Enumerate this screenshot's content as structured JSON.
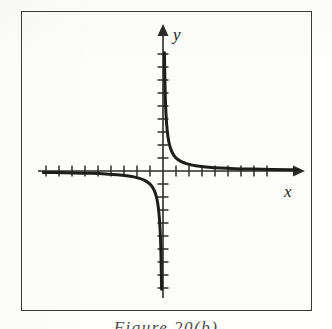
{
  "figure": {
    "caption": "Figure 20(b)",
    "frame": {
      "stroke_color": "#3a3a38",
      "background_color": "#fdfdfb"
    }
  },
  "axes": {
    "x_label": "x",
    "y_label": "y",
    "origin": {
      "x": 163,
      "y": 171
    },
    "tick_spacing_px": 13,
    "x_axis": {
      "start_x": 38,
      "end_x": 299,
      "arrow": "right"
    },
    "y_axis": {
      "start_y": 298,
      "end_y": 29,
      "arrow": "up"
    },
    "x_ticks_left": 9,
    "x_ticks_right": 8,
    "y_ticks_up": 9,
    "y_ticks_down": 9,
    "axis_color": "#2b2b29"
  },
  "chart_data": {
    "type": "line",
    "title": "Figure 20(b)",
    "xlabel": "x",
    "ylabel": "y",
    "function": "y = 1/x",
    "grid": false,
    "legend": null,
    "axis_ranges": {
      "xlim": [
        -9.6,
        10.5
      ],
      "ylim": [
        -10.9,
        10.9
      ]
    },
    "tick_interval": 1,
    "curve_color": "#1d1d1b",
    "curve_width_px": 3,
    "series": [
      {
        "name": "branch-upper-right",
        "quadrant": 1,
        "x": [
          0.11,
          0.12,
          0.14,
          0.16,
          0.19,
          0.22,
          0.26,
          0.31,
          0.37,
          0.45,
          0.55,
          0.68,
          0.85,
          1.05,
          1.3,
          1.6,
          2.0,
          2.5,
          3.1,
          3.9,
          4.9,
          6.1,
          7.6,
          9.2,
          10.4
        ],
        "y": [
          9.09,
          8.33,
          7.14,
          6.25,
          5.26,
          4.55,
          3.85,
          3.23,
          2.7,
          2.22,
          1.82,
          1.47,
          1.18,
          0.95,
          0.77,
          0.63,
          0.5,
          0.4,
          0.32,
          0.26,
          0.2,
          0.16,
          0.13,
          0.11,
          0.1
        ]
      },
      {
        "name": "branch-lower-left",
        "quadrant": 3,
        "x": [
          -0.11,
          -0.12,
          -0.14,
          -0.16,
          -0.19,
          -0.22,
          -0.26,
          -0.31,
          -0.37,
          -0.45,
          -0.55,
          -0.68,
          -0.85,
          -1.05,
          -1.3,
          -1.6,
          -2.0,
          -2.5,
          -3.1,
          -3.9,
          -4.9,
          -6.1,
          -7.6,
          -9.2
        ],
        "y": [
          -9.09,
          -8.33,
          -7.14,
          -6.25,
          -5.26,
          -4.55,
          -3.85,
          -3.23,
          -2.7,
          -2.22,
          -1.82,
          -1.47,
          -1.18,
          -0.95,
          -0.77,
          -0.63,
          -0.5,
          -0.4,
          -0.32,
          -0.26,
          -0.2,
          -0.16,
          -0.13,
          -0.11
        ]
      }
    ],
    "asymptotes": {
      "vertical": 0,
      "horizontal": 0
    }
  }
}
